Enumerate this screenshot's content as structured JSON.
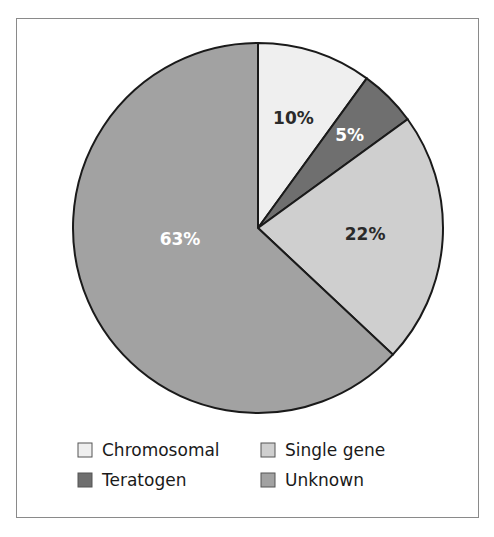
{
  "chart_data": {
    "type": "pie",
    "title": "",
    "start": "top",
    "direction": "clockwise",
    "slices": [
      {
        "label": "Chromosomal",
        "value": 10,
        "text": "10%",
        "color": "#efefef",
        "text_color": "#2a2a2a"
      },
      {
        "label": "Teratogen",
        "value": 5,
        "text": "5%",
        "color": "#6f6f6f",
        "text_color": "#ffffff"
      },
      {
        "label": "Single gene",
        "value": 22,
        "text": "22%",
        "color": "#cfcfcf",
        "text_color": "#2a2a2a"
      },
      {
        "label": "Unknown",
        "value": 63,
        "text": "63%",
        "color": "#a2a2a2",
        "text_color": "#ffffff"
      }
    ],
    "legend": {
      "placement": "bottom",
      "entries": [
        "Chromosomal",
        "Single gene",
        "Teratogen",
        "Unknown"
      ]
    },
    "stroke_color": "#1a1a1a"
  }
}
